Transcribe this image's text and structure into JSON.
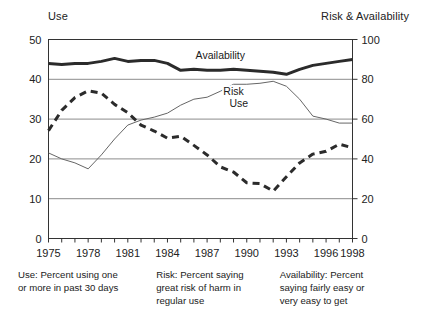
{
  "chart_data": {
    "type": "line",
    "title": "",
    "left_axis": {
      "label": "Use",
      "ticks": [
        0,
        10,
        20,
        30,
        40,
        50
      ],
      "ylim": [
        0,
        50
      ]
    },
    "right_axis": {
      "label": "Risk & Availability",
      "ticks": [
        0,
        20,
        40,
        60,
        80,
        100
      ],
      "ylim": [
        0,
        100
      ]
    },
    "xlabel": "",
    "xlim": [
      1975,
      1998
    ],
    "grid": true,
    "legend_position": "inline-on-curve",
    "x": [
      1975,
      1976,
      1977,
      1978,
      1979,
      1980,
      1981,
      1982,
      1983,
      1984,
      1985,
      1986,
      1987,
      1988,
      1989,
      1990,
      1991,
      1992,
      1993,
      1994,
      1995,
      1996,
      1997,
      1998
    ],
    "tick_labels": [
      "1975",
      "1978",
      "1981",
      "1984",
      "1987",
      "1990",
      "1993",
      "1996",
      "1998"
    ],
    "tick_years": [
      1975,
      1978,
      1981,
      1984,
      1987,
      1990,
      1993,
      1996,
      1998
    ],
    "series": [
      {
        "name": "Availability",
        "axis": "right",
        "style": "thick-solid",
        "color": "#2b2b2b",
        "label_x": 1988,
        "label_y": 90,
        "values": [
          88,
          87.5,
          88,
          88,
          89,
          90.5,
          89,
          89.5,
          89.5,
          88,
          84.5,
          85,
          84.5,
          84.5,
          85,
          84.5,
          84,
          83.5,
          82.5,
          85,
          87,
          88,
          89,
          90
        ]
      },
      {
        "name": "Risk",
        "axis": "right",
        "style": "thin-solid",
        "color": "#666666",
        "label_x": 1989,
        "label_y": 72,
        "values": [
          43,
          40,
          38,
          35,
          42,
          50,
          57,
          59.5,
          61,
          63,
          67,
          70,
          71,
          74,
          77.5,
          77.5,
          78,
          79,
          76.5,
          70,
          61.5,
          60,
          58,
          58
        ]
      },
      {
        "name": "Use",
        "axis": "left",
        "style": "thick-dashed",
        "color": "#2b2b2b",
        "label_x": 1989.4,
        "label_y": 33,
        "values": [
          27.1,
          32.2,
          35.4,
          37.1,
          36.5,
          33.7,
          31.6,
          28.5,
          27.0,
          25.2,
          25.7,
          23.4,
          21.0,
          18.0,
          16.7,
          14.0,
          13.8,
          11.9,
          15.5,
          19.0,
          21.2,
          21.9,
          23.7,
          22.8
        ]
      }
    ],
    "notes": [
      "Use: Percent using one\nor more in past 30 days",
      "Risk: Percent saying\ngreat risk of harm in\nregular use",
      "Availability: Percent\nsaying fairly easy or\nvery easy to get"
    ]
  }
}
